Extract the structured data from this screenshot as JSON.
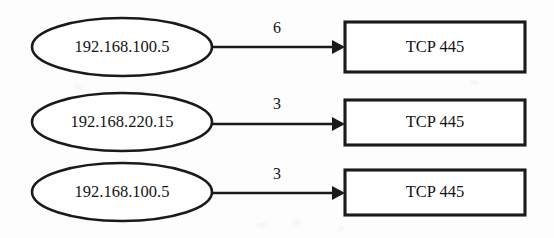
{
  "diagram": {
    "type": "network-flow-diagram",
    "title": "",
    "background_color": "#fdfdfd",
    "stroke_color": "#1a1a1a",
    "text_color": "#141414",
    "rows": [
      {
        "source_label": "192.168.100.5",
        "edge_label": "6",
        "target_label": "TCP 445"
      },
      {
        "source_label": "192.168.220.15",
        "edge_label": "3",
        "target_label": "TCP 445"
      },
      {
        "source_label": "192.168.100.5",
        "edge_label": "3",
        "target_label": "TCP 445"
      }
    ]
  }
}
